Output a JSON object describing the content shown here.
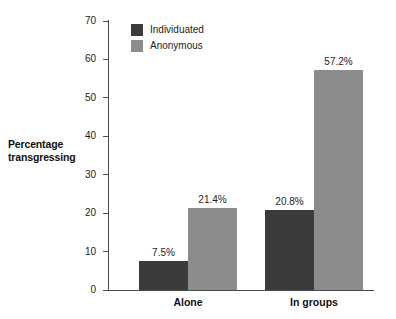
{
  "chart_data": {
    "type": "bar",
    "title": "",
    "xlabel": "",
    "ylabel": "Percentage transgressing",
    "ylim": [
      0,
      70
    ],
    "yticks": [
      0,
      10,
      20,
      30,
      40,
      50,
      60,
      70
    ],
    "ytick_labels": [
      "0",
      "10",
      "20",
      "30",
      "40",
      "50",
      "60",
      "70"
    ],
    "grid": false,
    "legend_position": "top-left-inside",
    "categories": [
      "Alone",
      "In groups"
    ],
    "series": [
      {
        "name": "Individuated",
        "color": "#3b3b3b",
        "values": [
          7.5,
          20.8
        ],
        "data_labels": [
          "7.5%",
          "20.8%"
        ]
      },
      {
        "name": "Anonymous",
        "color": "#8b8d8d",
        "values": [
          21.4,
          57.2
        ],
        "data_labels": [
          "21.4%",
          "57.2%"
        ]
      }
    ]
  },
  "axis_title": {
    "line1": "Percentage",
    "line2": "transgressing"
  },
  "colors": {
    "individuated": "#3b3b3b",
    "anonymous": "#8b8d8d",
    "axis": "#4a4a4a",
    "text": "#1c1c1c",
    "background": "#ffffff"
  }
}
